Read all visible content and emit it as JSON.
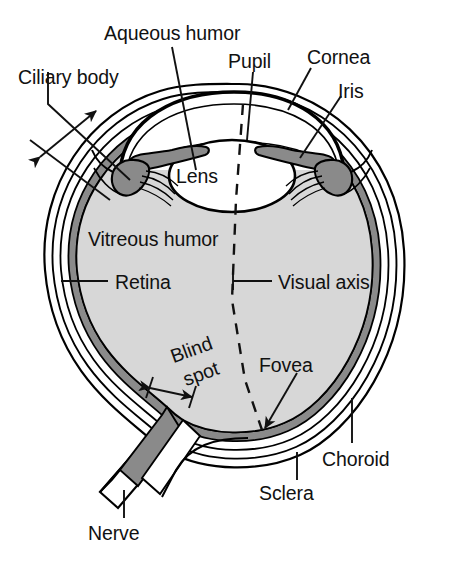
{
  "figure": {
    "type": "anatomical-diagram",
    "background_color": "#ffffff",
    "ink_color": "#111111"
  },
  "colors": {
    "vitreous_fill": "#d7d7d7",
    "choroid_fill": "#8a8a8a",
    "iris_fill": "#8a8a8a",
    "lens_fill": "#ffffff",
    "sclera_fill": "#ffffff",
    "nerve_fill": "#8a8a8a",
    "outline": "#000000"
  },
  "labels": {
    "aqueous_humor": "Aqueous humor",
    "pupil": "Pupil",
    "cornea": "Cornea",
    "iris": "Iris",
    "ciliary_body": "Ciliary body",
    "lens": "Lens",
    "vitreous_humor": "Vitreous humor",
    "retina": "Retina",
    "visual_axis": "Visual axis",
    "blind_spot_line1": "Blind",
    "blind_spot_line2": "spot",
    "fovea": "Fovea",
    "choroid": "Choroid",
    "sclera": "Sclera",
    "nerve": "Nerve"
  },
  "structures": [
    {
      "name": "cornea",
      "description": "transparent front dome",
      "label": "Cornea"
    },
    {
      "name": "aqueous-humor",
      "description": "fluid chamber behind cornea",
      "label": "Aqueous humor"
    },
    {
      "name": "pupil",
      "description": "central opening in iris",
      "label": "Pupil"
    },
    {
      "name": "iris",
      "description": "pigmented ring around pupil",
      "label": "Iris"
    },
    {
      "name": "lens",
      "description": "biconvex focusing body",
      "label": "Lens"
    },
    {
      "name": "ciliary-body",
      "description": "muscle ring suspending lens",
      "label": "Ciliary body"
    },
    {
      "name": "vitreous-humor",
      "description": "gel filling main chamber",
      "label": "Vitreous humor"
    },
    {
      "name": "retina",
      "description": "inner light-sensitive layer",
      "label": "Retina"
    },
    {
      "name": "choroid",
      "description": "vascular middle layer",
      "label": "Choroid"
    },
    {
      "name": "sclera",
      "description": "tough outer white coat",
      "label": "Sclera"
    },
    {
      "name": "fovea",
      "description": "point of sharpest vision",
      "label": "Fovea"
    },
    {
      "name": "blind-spot",
      "description": "optic disc, no receptors",
      "label": "Blind spot"
    },
    {
      "name": "optic-nerve",
      "description": "nerve bundle leaving eye",
      "label": "Nerve"
    },
    {
      "name": "visual-axis",
      "description": "dashed line pupil to fovea",
      "label": "Visual axis"
    }
  ]
}
